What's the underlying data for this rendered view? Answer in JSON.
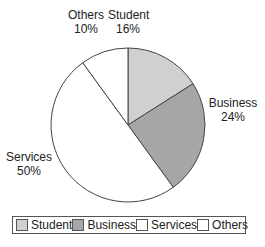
{
  "chart_data": {
    "type": "pie",
    "title": "",
    "categories": [
      "Student",
      "Business",
      "Services",
      "Others"
    ],
    "values": [
      16,
      24,
      50,
      10
    ],
    "value_labels": [
      "16%",
      "24%",
      "50%",
      "10%"
    ],
    "colors": [
      "#d0d0d0",
      "#a6a6a6",
      "#ffffff",
      "#ffffff"
    ],
    "legend_position": "bottom",
    "start_angle_deg": 0,
    "direction": "clockwise"
  },
  "labels": {
    "student": {
      "name": "Student",
      "pct": "16%"
    },
    "business": {
      "name": "Business",
      "pct": "24%"
    },
    "services": {
      "name": "Services",
      "pct": "50%"
    },
    "others": {
      "name": "Others",
      "pct": "10%"
    }
  },
  "legend": [
    "Student",
    "Business",
    "Services",
    "Others"
  ]
}
